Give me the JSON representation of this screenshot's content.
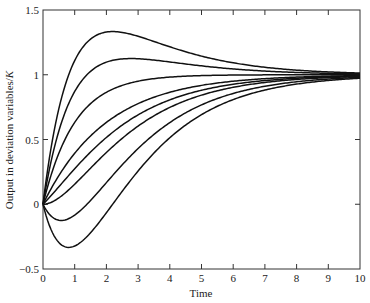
{
  "chart_data": {
    "type": "line",
    "title": "",
    "xlabel": "Time",
    "ylabel": "Output in deviation variables/",
    "ylabel_italic": "K",
    "xlim": [
      0,
      10
    ],
    "ylim": [
      -0.5,
      1.5
    ],
    "xticks": [
      0,
      1,
      2,
      3,
      4,
      5,
      6,
      7,
      8,
      9,
      10
    ],
    "xtick_labels": [
      "0",
      "1",
      "2",
      "3",
      "4",
      "5",
      "6",
      "7",
      "8",
      "9",
      "10"
    ],
    "yticks": [
      -0.5,
      0,
      0.5,
      1,
      1.5
    ],
    "ytick_labels": [
      "−0.5",
      "0",
      "0.5",
      "1",
      "1.5"
    ],
    "grid": false,
    "legend": null,
    "line_color": "#111111",
    "model": "y(t) = 1 + (ta - t1)/(t1 - t2) * exp(-t/t1) - (ta - t2)/(t1 - t2) * exp(-t/t2)",
    "tau1": 2,
    "tau2": 1,
    "series": [
      {
        "name": "curve-1",
        "tau_a": 4,
        "x": [
          0,
          0.5,
          1,
          1.5,
          2,
          2.2,
          2.5,
          3,
          4,
          5,
          6,
          7,
          8,
          9,
          10
        ],
        "values": [
          0,
          0.738,
          1.11,
          1.277,
          1.332,
          1.333,
          1.328,
          1.297,
          1.216,
          1.144,
          1.092,
          1.057,
          1.036,
          1.022,
          1.013
        ]
      },
      {
        "name": "curve-2",
        "tau_a": 3,
        "x": [
          0,
          0.5,
          1,
          1.5,
          2,
          2.5,
          2.77,
          3,
          4,
          5,
          6,
          7,
          8,
          9,
          10
        ],
        "values": [
          0,
          0.565,
          0.871,
          1.026,
          1.097,
          1.122,
          1.125,
          1.124,
          1.099,
          1.069,
          1.045,
          1.028,
          1.018,
          1.011,
          1.007
        ]
      },
      {
        "name": "curve-3",
        "tau_a": 2,
        "x": [
          0,
          0.5,
          1,
          1.5,
          2,
          2.5,
          3,
          4,
          5,
          6,
          7,
          8,
          9,
          10
        ],
        "values": [
          0,
          0.393,
          0.632,
          0.777,
          0.865,
          0.918,
          0.95,
          0.982,
          0.993,
          0.998,
          0.999,
          1.0,
          1.0,
          1.0
        ]
      },
      {
        "name": "curve-4",
        "tau_a": 1,
        "x": [
          0,
          0.5,
          1,
          1.5,
          2,
          2.5,
          3,
          4,
          5,
          6,
          7,
          8,
          9,
          10
        ],
        "values": [
          0,
          0.221,
          0.393,
          0.528,
          0.632,
          0.713,
          0.777,
          0.865,
          0.918,
          0.95,
          0.97,
          0.982,
          0.989,
          0.993
        ]
      },
      {
        "name": "curve-5",
        "tau_a": 0.5,
        "x": [
          0,
          0.5,
          1,
          1.5,
          2,
          2.5,
          3,
          4,
          5,
          6,
          7,
          8,
          9,
          10
        ],
        "values": [
          0,
          0.135,
          0.274,
          0.403,
          0.516,
          0.611,
          0.69,
          0.806,
          0.88,
          0.926,
          0.955,
          0.973,
          0.983,
          0.99
        ]
      },
      {
        "name": "curve-6",
        "tau_a": 0,
        "x": [
          0,
          0.5,
          1,
          1.5,
          2,
          2.5,
          3,
          4,
          5,
          6,
          7,
          8,
          9,
          10
        ],
        "values": [
          0,
          0.048,
          0.155,
          0.278,
          0.4,
          0.51,
          0.603,
          0.747,
          0.843,
          0.903,
          0.941,
          0.964,
          0.978,
          0.987
        ]
      },
      {
        "name": "curve-7",
        "tau_a": -1,
        "x": [
          0,
          0.5,
          0.8,
          1,
          1.5,
          2,
          2.5,
          3,
          4,
          5,
          6,
          7,
          8,
          9,
          10
        ],
        "values": [
          0,
          -0.123,
          -0.112,
          -0.084,
          0.034,
          0.167,
          0.297,
          0.43,
          0.631,
          0.767,
          0.856,
          0.911,
          0.946,
          0.967,
          0.98
        ]
      },
      {
        "name": "curve-8",
        "tau_a": -2,
        "x": [
          0,
          0.5,
          0.8,
          1,
          1.5,
          2,
          2.5,
          3,
          4,
          5,
          6,
          7,
          8,
          9,
          10
        ],
        "values": [
          0,
          -0.296,
          -0.333,
          -0.322,
          -0.225,
          -0.066,
          0.104,
          0.257,
          0.514,
          0.691,
          0.808,
          0.882,
          0.927,
          0.956,
          0.973
        ]
      }
    ]
  }
}
